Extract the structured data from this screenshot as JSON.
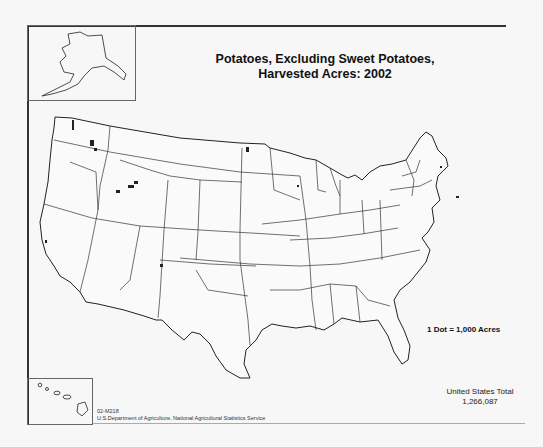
{
  "map": {
    "title_line1": "Potatoes, Excluding Sweet Potatoes,",
    "title_line2": "Harvested Acres:  2002",
    "legend": "1 Dot = 1,000 Acres",
    "total_label": "United States Total",
    "total_value": "1,266,087",
    "map_id": "02-M218",
    "source": "U.S.Department of Agriculture, National Agricultural Statistics Service",
    "insets": [
      "Alaska",
      "Hawaii"
    ],
    "colors": {
      "border": "#333333",
      "background": "#f7f7f7",
      "dots": "#222222"
    }
  }
}
